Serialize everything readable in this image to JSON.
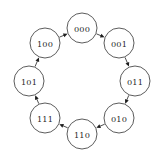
{
  "diagram": {
    "background_color": "#ffffff",
    "node_fill_color": "#ffffff",
    "node_stroke_color": "#4a4a4a",
    "edge_color": "#3a3a3a",
    "arrow_color": "#1d1d1d",
    "label_color": "#2a2a2a",
    "node_radius": 15,
    "center": {
      "x": 82,
      "y": 81
    },
    "ring_radius": 53,
    "nodes": [
      {
        "id": "n000",
        "label": "000",
        "angle_deg": 270,
        "cx": 82,
        "cy": 28
      },
      {
        "id": "n001",
        "label": "001",
        "angle_deg": 315,
        "cx": 119,
        "cy": 43
      },
      {
        "id": "n011",
        "label": "011",
        "angle_deg": 0,
        "cx": 135,
        "cy": 81
      },
      {
        "id": "n010",
        "label": "010",
        "angle_deg": 45,
        "cx": 119,
        "cy": 118
      },
      {
        "id": "n110",
        "label": "110",
        "angle_deg": 90,
        "cx": 82,
        "cy": 134
      },
      {
        "id": "n111",
        "label": "111",
        "angle_deg": 135,
        "cx": 45,
        "cy": 118
      },
      {
        "id": "n101",
        "label": "101",
        "angle_deg": 180,
        "cx": 29,
        "cy": 81
      },
      {
        "id": "n100",
        "label": "100",
        "angle_deg": 225,
        "cx": 45,
        "cy": 43
      }
    ],
    "edges": [
      {
        "from": "n000",
        "to": "n001",
        "direction": "clockwise"
      },
      {
        "from": "n001",
        "to": "n011",
        "direction": "clockwise"
      },
      {
        "from": "n011",
        "to": "n010",
        "direction": "clockwise"
      },
      {
        "from": "n010",
        "to": "n110",
        "direction": "clockwise"
      },
      {
        "from": "n110",
        "to": "n111",
        "direction": "clockwise"
      },
      {
        "from": "n111",
        "to": "n101",
        "direction": "clockwise"
      },
      {
        "from": "n101",
        "to": "n100",
        "direction": "clockwise"
      },
      {
        "from": "n100",
        "to": "n000",
        "direction": "clockwise"
      }
    ]
  }
}
